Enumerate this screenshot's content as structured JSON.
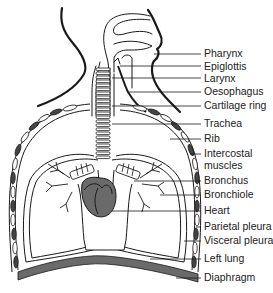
{
  "diagram": {
    "colors": {
      "line": "#1a1a1a",
      "fill_dark": "#6a6a6a",
      "background": "#ffffff"
    },
    "labels": [
      {
        "text": "Pharynx",
        "y": 48
      },
      {
        "text": "Epiglottis",
        "y": 61
      },
      {
        "text": "Larynx",
        "y": 74
      },
      {
        "text": "Oesophagus",
        "y": 87
      },
      {
        "text": "Cartilage ring",
        "y": 101
      },
      {
        "text": "Trachea",
        "y": 118
      },
      {
        "text": "Rib",
        "y": 134
      },
      {
        "text": "Intercostal",
        "y": 149
      },
      {
        "text": "muscles",
        "y": 160
      },
      {
        "text": "Bronchus",
        "y": 176
      },
      {
        "text": "Bronchiole",
        "y": 189
      },
      {
        "text": "Heart",
        "y": 206
      },
      {
        "text": "Parietal pleura",
        "y": 222
      },
      {
        "text": "Visceral pleura",
        "y": 236
      },
      {
        "text": "Left lung",
        "y": 254
      },
      {
        "text": "Diaphragm",
        "y": 272
      }
    ]
  }
}
